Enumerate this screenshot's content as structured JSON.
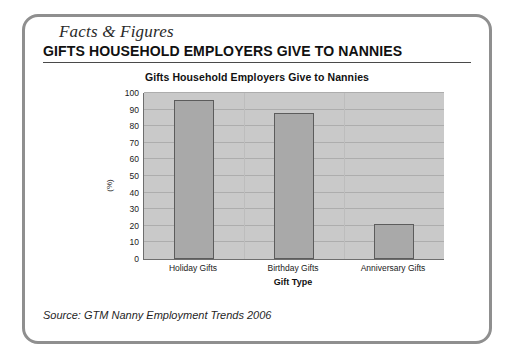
{
  "panel": {
    "tab_label": "Facts & Figures",
    "heading": "GIFTS HOUSEHOLD EMPLOYERS GIVE TO NANNIES",
    "source": "Source: GTM Nanny Employment Trends 2006"
  },
  "colors": {
    "frame_border": "#8f8f8f",
    "heading_rule": "#4a4a4a",
    "plot_background": "#c9c9c9",
    "bar_fill": "#a9a9a9",
    "bar_outline": "#5c5c5c",
    "gridline": "#adadad",
    "axis_line": "#6e6e6e"
  },
  "chart_data": {
    "type": "bar",
    "title": "Gifts Household Employers Give to Nannies",
    "xlabel": "Gift Type",
    "ylabel": "(%)",
    "categories": [
      "Holiday Gifts",
      "Birthday Gifts",
      "Anniversary Gifts"
    ],
    "values": [
      96,
      88,
      21
    ],
    "ylim": [
      0,
      100
    ],
    "yticks": [
      100,
      90,
      80,
      70,
      60,
      50,
      40,
      30,
      20,
      10,
      0
    ],
    "grid": true,
    "legend": "none"
  }
}
